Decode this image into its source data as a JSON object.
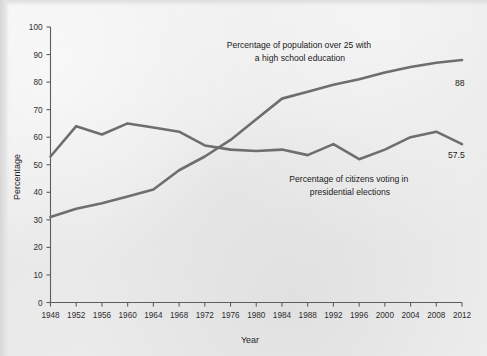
{
  "chart_data": {
    "type": "line",
    "title": "",
    "xlabel": "Year",
    "ylabel": "Percentage",
    "xlim": [
      1948,
      2012
    ],
    "ylim": [
      0,
      100
    ],
    "ytick_step": 10,
    "xtick_step": 4,
    "grid": false,
    "legend_position": "inline-annotations",
    "x": [
      1948,
      1952,
      1956,
      1960,
      1964,
      1968,
      1972,
      1976,
      1980,
      1984,
      1988,
      1992,
      1996,
      2000,
      2004,
      2008,
      2012
    ],
    "yticks": [
      0,
      10,
      20,
      30,
      40,
      50,
      60,
      70,
      80,
      90,
      100
    ],
    "xticks": [
      "1948",
      "1952",
      "1956",
      "1960",
      "1964",
      "1968",
      "1972",
      "1976",
      "1980",
      "1984",
      "1988",
      "1992",
      "1996",
      "2000",
      "2004",
      "2008",
      "2012"
    ],
    "series": [
      {
        "name": "Percentage of population over 25 with a high school education",
        "annotation_lines": [
          "Percentage of population over 25 with",
          "a high school education"
        ],
        "end_label": "88",
        "color": "#6e6e6e",
        "values": [
          31,
          34,
          36,
          38.5,
          41,
          48,
          53,
          59,
          66.5,
          74,
          76.5,
          79,
          81,
          83.5,
          85.5,
          87,
          88
        ]
      },
      {
        "name": "Percentage of citizens voting in presidential elections",
        "annotation_lines": [
          "Percentage of citizens voting in",
          "presidential elections"
        ],
        "end_label": "57.5",
        "color": "#6e6e6e",
        "values": [
          53,
          64,
          61,
          65,
          63.5,
          62,
          57,
          55.5,
          55,
          55.5,
          53.5,
          57.5,
          52,
          55.5,
          60,
          62,
          57.5
        ]
      }
    ],
    "annotations": [
      {
        "name": "education-annotation",
        "lines": [
          "Percentage of population over 25 with",
          "a high school education"
        ]
      },
      {
        "name": "voting-annotation",
        "lines": [
          "Percentage of citizens voting in",
          "presidential elections"
        ]
      }
    ],
    "data_labels": [
      {
        "name": "education-end-label",
        "text": "88",
        "value": 88
      },
      {
        "name": "voting-end-label",
        "text": "57.5",
        "value": 57.5
      }
    ]
  }
}
